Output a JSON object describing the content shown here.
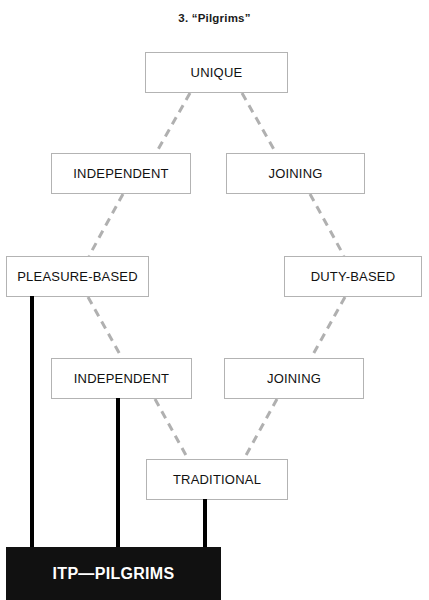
{
  "title": "3. “Pilgrims”",
  "colors": {
    "box_border": "#b3b3b3",
    "box_fill": "#ffffff",
    "text": "#111111",
    "dashed_edge": "#b0b0b0",
    "solid_edge": "#000000",
    "terminal_fill": "#111111",
    "terminal_text": "#ffffff",
    "background": "#ffffff"
  },
  "nodes": [
    {
      "id": "unique",
      "label": "UNIQUE",
      "x": 145,
      "y": 52,
      "w": 143,
      "h": 41
    },
    {
      "id": "independent-1",
      "label": "INDEPENDENT",
      "x": 51,
      "y": 153,
      "w": 140,
      "h": 41
    },
    {
      "id": "joining-1",
      "label": "JOINING",
      "x": 226,
      "y": 153,
      "w": 139,
      "h": 41
    },
    {
      "id": "pleasure",
      "label": "PLEASURE-BASED",
      "x": 6,
      "y": 256,
      "w": 143,
      "h": 41
    },
    {
      "id": "duty",
      "label": "DUTY-BASED",
      "x": 284,
      "y": 256,
      "w": 138,
      "h": 41
    },
    {
      "id": "independent-2",
      "label": "INDEPENDENT",
      "x": 51,
      "y": 358,
      "w": 141,
      "h": 41
    },
    {
      "id": "joining-2",
      "label": "JOINING",
      "x": 224,
      "y": 358,
      "w": 140,
      "h": 41
    },
    {
      "id": "traditional",
      "label": "TRADITIONAL",
      "x": 146,
      "y": 459,
      "w": 142,
      "h": 41
    }
  ],
  "dashed_edges": [
    {
      "from": "unique",
      "to": "independent-1",
      "x1": 190,
      "y1": 93,
      "x2": 156,
      "y2": 153
    },
    {
      "from": "unique",
      "to": "joining-1",
      "x1": 242,
      "y1": 93,
      "x2": 276,
      "y2": 153
    },
    {
      "from": "independent-1",
      "to": "pleasure",
      "x1": 123,
      "y1": 194,
      "x2": 89,
      "y2": 256
    },
    {
      "from": "joining-1",
      "to": "duty",
      "x1": 310,
      "y1": 194,
      "x2": 344,
      "y2": 256
    },
    {
      "from": "pleasure",
      "to": "independent-2",
      "x1": 88,
      "y1": 297,
      "x2": 122,
      "y2": 358
    },
    {
      "from": "duty",
      "to": "joining-2",
      "x1": 345,
      "y1": 297,
      "x2": 311,
      "y2": 358
    },
    {
      "from": "independent-2",
      "to": "traditional",
      "x1": 155,
      "y1": 399,
      "x2": 188,
      "y2": 459
    },
    {
      "from": "joining-2",
      "to": "traditional",
      "x1": 277,
      "y1": 399,
      "x2": 244,
      "y2": 459
    }
  ],
  "solid_edges": [
    {
      "from": "pleasure",
      "to": "terminal",
      "x": 30,
      "y": 296,
      "h": 252,
      "w": 4
    },
    {
      "from": "independent-2",
      "to": "terminal",
      "x": 116,
      "y": 398,
      "h": 150,
      "w": 4
    },
    {
      "from": "traditional",
      "to": "terminal",
      "x": 203,
      "y": 499,
      "h": 49,
      "w": 4
    }
  ],
  "terminal": {
    "label": "ITP—PILGRIMS",
    "x": 6,
    "y": 547,
    "w": 215,
    "h": 53
  }
}
